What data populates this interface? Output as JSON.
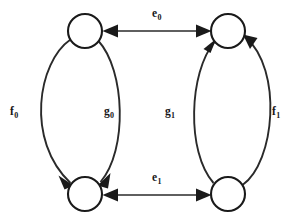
{
  "figure": {
    "kind": "state-transition-diagram",
    "background_color": "#ffffff",
    "stroke_color": "#2a2a2a",
    "node_fill_color": "#ffffff",
    "label_color": "#171717",
    "width": 304,
    "height": 224
  },
  "nodes": [
    {
      "id": "top-left",
      "label": "",
      "cx": 85,
      "cy": 31,
      "r": 17
    },
    {
      "id": "top-right",
      "label": "",
      "cx": 228,
      "cy": 31,
      "r": 17
    },
    {
      "id": "bottom-left",
      "label": "",
      "cx": 85,
      "cy": 194,
      "r": 17
    },
    {
      "id": "bottom-right",
      "label": "",
      "cx": 228,
      "cy": 194,
      "r": 17
    }
  ],
  "edges": [
    {
      "id": "e0",
      "label_base": "e",
      "label_sub": "0",
      "label_text": "e0",
      "from": "top-right",
      "to": "top-left",
      "shape": "straight",
      "bidirectional": true,
      "label_x": 152,
      "label_y": 8
    },
    {
      "id": "e1",
      "label_base": "e",
      "label_sub": "1",
      "label_text": "e1",
      "from": "bottom-left",
      "to": "bottom-right",
      "shape": "straight",
      "bidirectional": true,
      "label_x": 152,
      "label_y": 172
    },
    {
      "id": "f0",
      "label_base": "f",
      "label_sub": "0",
      "label_text": "f0",
      "from": "top-left",
      "to": "bottom-left",
      "shape": "curve-left",
      "bidirectional": false,
      "label_x": 10,
      "label_y": 106
    },
    {
      "id": "g0",
      "label_base": "g",
      "label_sub": "0",
      "label_text": "g0",
      "from": "top-left",
      "to": "bottom-left",
      "shape": "curve-right",
      "bidirectional": false,
      "label_x": 104,
      "label_y": 106
    },
    {
      "id": "g1",
      "label_base": "g",
      "label_sub": "1",
      "label_text": "g1",
      "from": "bottom-right",
      "to": "top-right",
      "shape": "curve-left",
      "bidirectional": false,
      "label_x": 165,
      "label_y": 106
    },
    {
      "id": "f1",
      "label_base": "f",
      "label_sub": "1",
      "label_text": "f1",
      "from": "bottom-right",
      "to": "top-right",
      "shape": "curve-right",
      "bidirectional": false,
      "label_x": 272,
      "label_y": 106
    }
  ]
}
